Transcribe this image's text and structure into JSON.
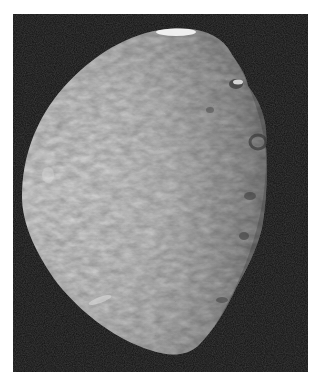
{
  "image": {
    "subject": "moon-photograph",
    "description": "Grayscale spacecraft photograph of a cratered icy moon, gibbous phase, lit from the left, on black space background",
    "colors": {
      "background": "#ffffff",
      "space": "#101010",
      "surface_light": "#d4d4d4",
      "surface_mid": "#a8a8a8",
      "surface_dark": "#5a5a5a",
      "highlight": "#f2f2f2"
    }
  }
}
